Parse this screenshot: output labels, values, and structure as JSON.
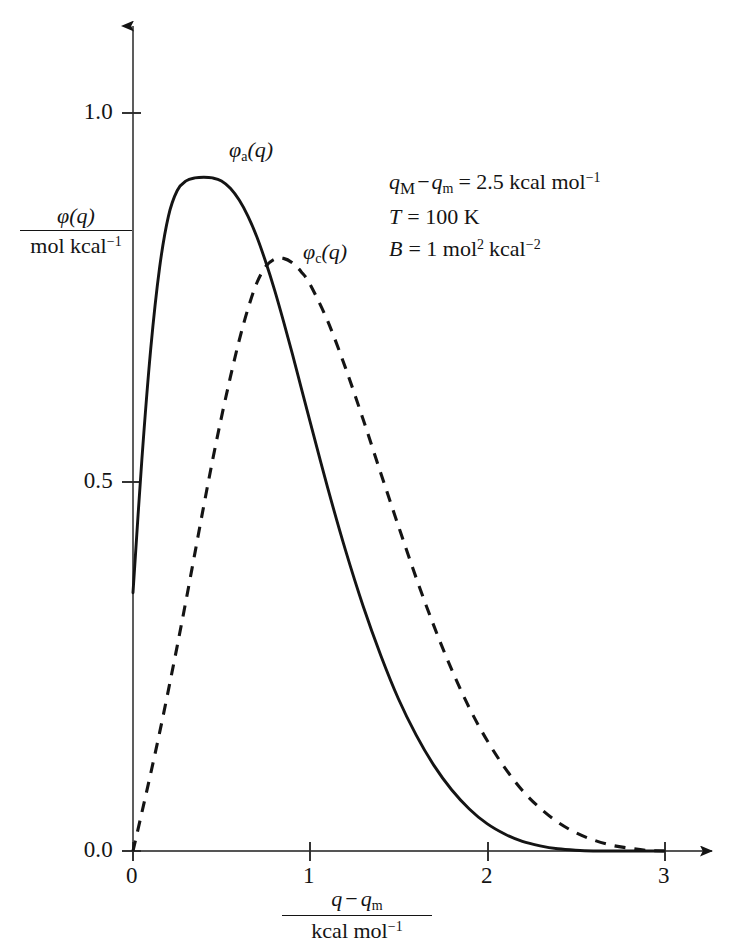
{
  "chart_data": {
    "type": "line",
    "title": "",
    "xlabel": "(q - q_m) / kcal mol^-1",
    "ylabel": "phi(q) / mol kcal^-1",
    "xlim": [
      0,
      3.1
    ],
    "ylim": [
      0,
      1.15
    ],
    "grid": false,
    "legend_position": "inline-curve-labels",
    "x_ticks": [
      {
        "value": 0,
        "label": "0"
      },
      {
        "value": 1,
        "label": "1"
      },
      {
        "value": 2,
        "label": "2"
      },
      {
        "value": 3,
        "label": "3"
      }
    ],
    "y_ticks": [
      {
        "value": 0.0,
        "label": "0.0"
      },
      {
        "value": 0.5,
        "label": "0.5"
      },
      {
        "value": 1.0,
        "label": "1.0"
      }
    ],
    "x": [
      0.0,
      0.05,
      0.1,
      0.15,
      0.2,
      0.25,
      0.3,
      0.35,
      0.4,
      0.45,
      0.5,
      0.55,
      0.6,
      0.65,
      0.7,
      0.75,
      0.8,
      0.85,
      0.9,
      0.95,
      1.0,
      1.1,
      1.2,
      1.3,
      1.4,
      1.5,
      1.6,
      1.7,
      1.8,
      1.9,
      2.0,
      2.1,
      2.2,
      2.3,
      2.4,
      2.5,
      2.6,
      2.7,
      2.8,
      2.9,
      3.0
    ],
    "series": [
      {
        "name": "phi_a(q)",
        "label": "φa(q)",
        "style": "solid",
        "color": "#141414",
        "values": [
          0.35,
          0.53,
          0.68,
          0.79,
          0.86,
          0.895,
          0.908,
          0.912,
          0.913,
          0.912,
          0.908,
          0.898,
          0.882,
          0.86,
          0.832,
          0.798,
          0.76,
          0.718,
          0.674,
          0.628,
          0.582,
          0.492,
          0.408,
          0.332,
          0.265,
          0.206,
          0.157,
          0.116,
          0.083,
          0.057,
          0.037,
          0.023,
          0.013,
          0.007,
          0.003,
          0.001,
          0.0,
          0.0,
          0.0,
          0.0,
          0.0
        ]
      },
      {
        "name": "phi_c(q)",
        "label": "φc(q)",
        "style": "dashed",
        "color": "#141414",
        "values": [
          0.0,
          0.052,
          0.105,
          0.16,
          0.218,
          0.278,
          0.34,
          0.404,
          0.468,
          0.53,
          0.588,
          0.642,
          0.692,
          0.735,
          0.77,
          0.792,
          0.802,
          0.803,
          0.797,
          0.785,
          0.768,
          0.718,
          0.655,
          0.585,
          0.512,
          0.44,
          0.37,
          0.305,
          0.246,
          0.194,
          0.15,
          0.113,
          0.082,
          0.058,
          0.039,
          0.025,
          0.015,
          0.008,
          0.004,
          0.001,
          0.0
        ]
      }
    ],
    "annotations": [
      {
        "id": "q-difference",
        "text": "qM − qm = 2.5 kcal mol⁻¹"
      },
      {
        "id": "temperature",
        "text": "T = 100 K"
      },
      {
        "id": "b-parameter",
        "text": "B = 1 mol² kcal⁻²"
      }
    ]
  },
  "axes": {
    "y_label": {
      "numerator_var": "φ",
      "numerator_arg": "(q)",
      "denominator": "mol kcal",
      "denominator_exp": "−1"
    },
    "x_label": {
      "numerator_a": "q",
      "numerator_minus": "−",
      "numerator_b": "q",
      "numerator_b_sub": "m",
      "denominator": "kcal mol",
      "denominator_exp": "−1"
    },
    "x_tick_labels": [
      "0",
      "1",
      "2",
      "3"
    ],
    "y_tick_labels": [
      "0.0",
      "0.5",
      "1.0"
    ]
  },
  "curve_labels": {
    "solid": {
      "symbol": "φ",
      "subscript": "a",
      "arg": "(q)"
    },
    "dashed": {
      "symbol": "φ",
      "subscript": "c",
      "arg": "(q)"
    }
  },
  "parameters": {
    "line1": {
      "lhs_q": "q",
      "lhs_sub_major": "M",
      "minus": "−",
      "rhs_q": "q",
      "rhs_sub_minor": "m",
      "equals": "= 2.5 kcal mol",
      "exponent": "−1"
    },
    "line2": {
      "symbol": "T",
      "value": "= 100 K"
    },
    "line3": {
      "symbol": "B",
      "value_pre": "= 1 mol",
      "exp1": "2",
      "value_mid": "kcal",
      "exp2": "−2"
    }
  },
  "style": {
    "background": "#ffffff",
    "ink": "#141414",
    "axis_color": "#4a4a4a"
  }
}
